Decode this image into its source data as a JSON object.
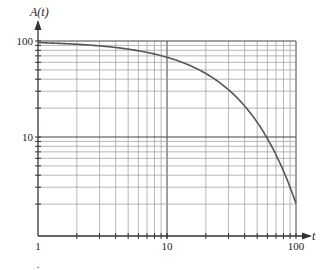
{
  "chart_data": {
    "type": "line",
    "title": "",
    "xlabel": "t",
    "ylabel": "A(t)",
    "xscale": "log",
    "yscale": "log",
    "xlim": [
      1,
      100
    ],
    "ylim": [
      1,
      100
    ],
    "grid": true,
    "x_tick_labels": [
      "1",
      "10",
      "100"
    ],
    "y_tick_labels": [
      "10",
      "100"
    ],
    "series": [
      {
        "name": "A(t)",
        "x": [
          1,
          2,
          3,
          5,
          7,
          10,
          15,
          20,
          30,
          40,
          50,
          60,
          70,
          80,
          90,
          100
        ],
        "y": [
          96,
          92.3,
          88.7,
          81.9,
          75.6,
          67,
          54.9,
          44.9,
          30.1,
          20.2,
          13.5,
          9.1,
          6.1,
          4.1,
          2.7,
          2.0
        ]
      }
    ]
  },
  "labels": {
    "y_axis": "A(t)",
    "x_axis": "t",
    "x_ticks": [
      "1",
      "10",
      "100"
    ],
    "y_ticks": [
      "10",
      "100"
    ],
    "footnote_mark": "."
  },
  "colors": {
    "curve": "#555555",
    "grid": "#9a9a9a",
    "axis": "#333333"
  }
}
